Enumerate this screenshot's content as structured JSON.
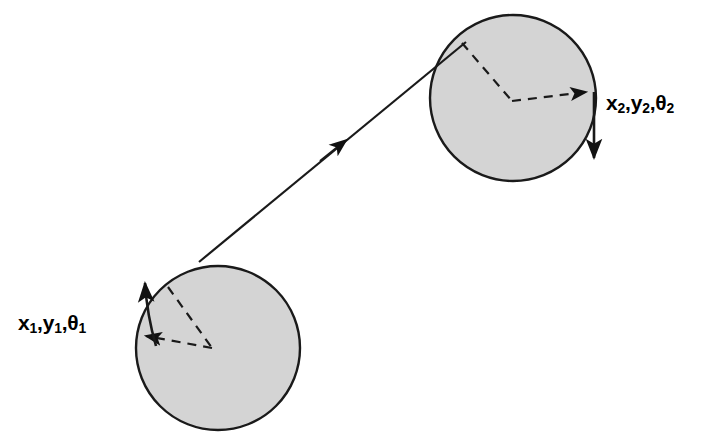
{
  "figure": {
    "background_color": "#ffffff",
    "width": 714,
    "height": 440
  },
  "labels": {
    "pose_1": {
      "text": "x₁,y₁,θ₁",
      "parts": [
        {
          "base": "x",
          "sub": "1"
        },
        {
          "base": "y",
          "sub": "1"
        },
        {
          "base": "θ",
          "sub": "2_placeholder"
        }
      ],
      "x_base": "x",
      "x_sub": "1",
      "y_base": "y",
      "y_sub": "1",
      "theta_base": "θ",
      "theta_sub": "1",
      "comma": ",",
      "color": "#000000"
    },
    "pose_2": {
      "text": "x₂,y₂,θ₂",
      "x_base": "x",
      "x_sub": "2",
      "y_base": "y",
      "y_sub": "2",
      "theta_base": "θ",
      "theta_sub": "2",
      "comma": ",",
      "color": "#000000"
    }
  },
  "shapes": {
    "circle_1": {
      "name": "robot-body-start",
      "cx": 218,
      "cy": 348,
      "r": 82,
      "fill": "#d4d4d4",
      "stroke": "#111111",
      "stroke_width": 2.4
    },
    "circle_2": {
      "name": "robot-body-goal",
      "cx": 513,
      "cy": 98,
      "r": 83,
      "fill": "#d4d4d4",
      "stroke": "#111111",
      "stroke_width": 2.4
    },
    "trajectory": {
      "name": "trajectory-arrow",
      "x1": 199,
      "y1": 262,
      "x2": 466,
      "y2": 42,
      "mid_arrow_at": {
        "x": 333,
        "y": 151
      },
      "stroke": "#111111",
      "stroke_width": 2.2
    },
    "heading_arrow_1": {
      "name": "heading-arrow-start",
      "from": {
        "x": 152,
        "y": 342
      },
      "to": {
        "x": 145,
        "y": 277
      },
      "stroke": "#111111",
      "stroke_width": 2.6
    },
    "heading_arrow_2": {
      "name": "heading-arrow-goal",
      "from": {
        "x": 594,
        "y": 92
      },
      "to": {
        "x": 594,
        "y": 164
      },
      "stroke": "#111111",
      "stroke_width": 2.6
    },
    "angle_marks_1": {
      "name": "angle-indicator-start",
      "vertex": {
        "x": 212,
        "y": 348
      },
      "ray_upper": {
        "x": 168,
        "y": 287
      },
      "ray_arrow": {
        "x": 140,
        "y": 336
      },
      "stroke": "#111111",
      "stroke_width": 2.2,
      "dash": "9 7"
    },
    "angle_marks_2": {
      "name": "angle-indicator-goal",
      "vertex": {
        "x": 512,
        "y": 101
      },
      "ray_upper": {
        "x": 462,
        "y": 43
      },
      "ray_arrow": {
        "x": 591,
        "y": 92
      },
      "stroke": "#111111",
      "stroke_width": 2.2,
      "dash": "9 7"
    }
  },
  "colors": {
    "body_fill": "#d4d4d4",
    "ink": "#111111",
    "background": "#ffffff"
  }
}
